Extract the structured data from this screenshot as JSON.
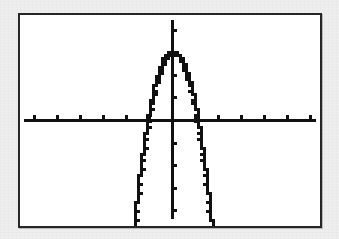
{
  "page": {
    "background_color": "#eeeeee"
  },
  "calculator_screen": {
    "label": "graphing-calculator-display",
    "background_color": "#ffffff",
    "border_color": "#262626",
    "border_width": 2,
    "left": 18,
    "top": 13,
    "width": 304,
    "height": 215
  },
  "chart_data": {
    "type": "line",
    "title": "",
    "subtitle": "",
    "xlabel": "",
    "ylabel": "",
    "grid": false,
    "legend": null,
    "annotations": [],
    "style": "pixelated-lcd",
    "curve_color": "#111111",
    "axis_color": "#111111",
    "equation": "y = -a(x)^2 + k",
    "vertex": [
      0,
      3
    ],
    "x_intercepts": [
      -1.05,
      1.0
    ],
    "xlim": [
      -6.6,
      6.35
    ],
    "ylim": [
      -6.7,
      4.55
    ],
    "xtick_step": 1,
    "ytick_step": 1,
    "xticks": [
      -6,
      -5,
      -4,
      -3,
      -2,
      -1,
      1,
      2,
      3,
      4,
      5,
      6
    ],
    "yticks": [
      -6,
      -5,
      -4,
      -3,
      -2,
      -1,
      1,
      2,
      3,
      4
    ],
    "x": [
      -1.55,
      -1.45,
      -1.35,
      -1.25,
      -1.15,
      -1.05,
      -0.95,
      -0.85,
      -0.75,
      -0.65,
      -0.55,
      -0.45,
      -0.35,
      -0.25,
      -0.15,
      -0.05,
      0.05,
      0.15,
      0.25,
      0.35,
      0.45,
      0.55,
      0.65,
      0.75,
      0.85,
      0.95,
      1.05,
      1.15,
      1.25,
      1.35,
      1.45,
      1.55,
      1.65,
      1.75
    ],
    "series": [
      {
        "name": "y1",
        "values": [
          -4.2,
          -3.3,
          -2.45,
          -1.65,
          -0.9,
          -0.2,
          0.45,
          1.05,
          1.6,
          2.1,
          2.45,
          2.7,
          2.88,
          2.96,
          3.0,
          3.0,
          3.0,
          2.96,
          2.88,
          2.7,
          2.45,
          2.1,
          1.6,
          1.05,
          0.45,
          -0.2,
          -0.9,
          -1.65,
          -2.45,
          -3.3,
          -4.2,
          -5.1,
          -6.0,
          -6.6
        ]
      }
    ]
  },
  "geometry_px": {
    "origin_x": 172,
    "origin_y": 120,
    "unit_x": 23,
    "unit_y": 22.6,
    "x_axis_start": 24,
    "x_axis_end": 316,
    "y_axis_top": 20,
    "y_axis_bottom": 219,
    "tick_len": 4,
    "axis_thickness": 3,
    "curve_thickness": 3
  }
}
